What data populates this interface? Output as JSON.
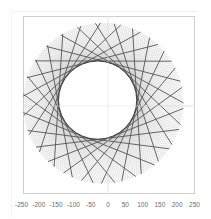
{
  "chart_data": {
    "type": "line",
    "title": "",
    "xlabel": "",
    "ylabel": "",
    "xlim": [
      -250,
      250
    ],
    "ylim": [
      -250,
      250
    ],
    "x_ticks": [
      -250,
      -200,
      -150,
      -100,
      -50,
      0,
      50,
      100,
      150,
      200,
      250
    ],
    "y_ticks": [],
    "grid": true,
    "legend": null,
    "figure": {
      "outer_radius": 232,
      "inner_envelope_radius": 113,
      "center": [
        -14,
        8
      ],
      "inner_circle_center": [
        -30,
        17
      ],
      "points": 25,
      "step": 8,
      "fine_line_count": 200
    },
    "colors": {
      "dark_line": "#555555",
      "fine_line": "#b8b8b8",
      "grid": "#e4e4e4",
      "frame": "#cfcfcf"
    }
  },
  "axis": {
    "tick_labels": [
      "-250",
      "-200",
      "-150",
      "-100",
      "-50",
      "0",
      "50",
      "100",
      "150",
      "200",
      "250"
    ]
  }
}
